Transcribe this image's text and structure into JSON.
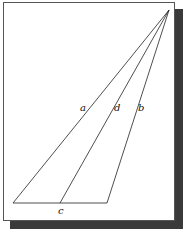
{
  "diagram": {
    "type": "triangle-with-cevian",
    "labels": {
      "a": "a",
      "b": "b",
      "c": "c",
      "d": "d"
    },
    "points": {
      "apex": [
        169,
        10
      ],
      "base_left": [
        13,
        203
      ],
      "base_right": [
        107,
        203
      ],
      "base_mid": [
        60,
        203
      ]
    },
    "colors": {
      "line": "#222222",
      "shadow": "#3a3a3a",
      "frame_border": "#555555"
    }
  }
}
